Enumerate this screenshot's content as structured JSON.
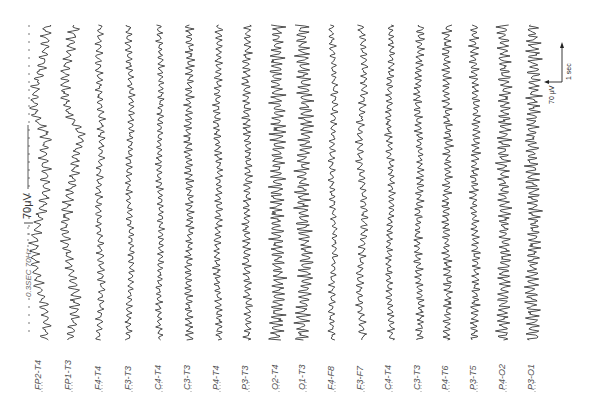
{
  "figure": {
    "header_annotation": {
      "settings": "0.3SEC 70Hz",
      "calibration": "70μV"
    },
    "scale_bar": {
      "time_label": "1 sec",
      "amplitude_label": "70 μV"
    }
  },
  "chart_data": {
    "type": "line",
    "title": "",
    "xlabel": "",
    "ylabel": "",
    "orientation": "rotated-90",
    "grid": false,
    "annotations": [
      "0.3SEC 70Hz",
      "70μV",
      "1 sec",
      "70 μV"
    ],
    "series": [
      {
        "name": "FP2-T4",
        "x": 40,
        "amp": 3.5,
        "freq": 0.55,
        "slow": 6,
        "note": "irregular with large slow deflection mid-record"
      },
      {
        "name": "FP1-T3",
        "x": 70,
        "amp": 3.5,
        "freq": 0.6,
        "slow": 5,
        "note": "irregular with slow deflection mid-record"
      },
      {
        "name": "F4-T4",
        "x": 100,
        "amp": 2.5,
        "freq": 0.6,
        "slow": 1.5
      },
      {
        "name": "F3-T3",
        "x": 130,
        "amp": 2.2,
        "freq": 0.65,
        "slow": 1.5
      },
      {
        "name": "C4-T4",
        "x": 160,
        "amp": 2.2,
        "freq": 0.7,
        "slow": 1
      },
      {
        "name": "C3-T3",
        "x": 189,
        "amp": 2.8,
        "freq": 0.75,
        "slow": 1
      },
      {
        "name": "P4-T4",
        "x": 218,
        "amp": 2.6,
        "freq": 0.7,
        "slow": 1
      },
      {
        "name": "P3-T3",
        "x": 247,
        "amp": 2.8,
        "freq": 0.7,
        "slow": 1
      },
      {
        "name": "O2-T4",
        "x": 277,
        "amp": 5.0,
        "freq": 0.75,
        "slow": 1,
        "note": "prominent rhythmic alpha"
      },
      {
        "name": "O1-T3",
        "x": 304,
        "amp": 5.0,
        "freq": 0.75,
        "slow": 2,
        "note": "prominent rhythmic alpha"
      },
      {
        "name": "F4-F8",
        "x": 333,
        "amp": 2.2,
        "freq": 0.6,
        "slow": 1.5
      },
      {
        "name": "F3-F7",
        "x": 362,
        "amp": 2.6,
        "freq": 0.6,
        "slow": 2.5
      },
      {
        "name": "C4-T4",
        "x": 390,
        "amp": 2.4,
        "freq": 0.7,
        "slow": 1.5
      },
      {
        "name": "C3-T3",
        "x": 419,
        "amp": 2.8,
        "freq": 0.75,
        "slow": 1.5
      },
      {
        "name": "P4-T6",
        "x": 447,
        "amp": 3.0,
        "freq": 0.75,
        "slow": 1
      },
      {
        "name": "P3-T5",
        "x": 475,
        "amp": 3.0,
        "freq": 0.75,
        "slow": 1
      },
      {
        "name": "P4-O2",
        "x": 504,
        "amp": 4.5,
        "freq": 0.75,
        "slow": 1,
        "note": "rhythmic alpha"
      },
      {
        "name": "P3-O1",
        "x": 533,
        "amp": 4.8,
        "freq": 0.75,
        "slow": 1,
        "note": "rhythmic alpha"
      }
    ]
  }
}
